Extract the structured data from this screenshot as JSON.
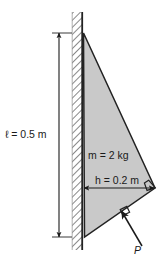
{
  "figure": {
    "background_color": "#ffffff",
    "plate": {
      "name": "triangular-plate",
      "fill_color": "#c9c9c9",
      "stroke_color": "#222222",
      "mass_label": "m = 2 kg",
      "mass_symbol": "m",
      "mass_value": "2",
      "mass_unit": "kg"
    },
    "wall": {
      "name": "vertical-wall",
      "hatch_color": "#555555",
      "line_color": "#222222"
    },
    "dimensions": [
      {
        "name": "length-dimension",
        "label": "ℓ = 0.5 m",
        "symbol": "ℓ",
        "value": "0.5",
        "unit": "m",
        "orientation": "vertical"
      },
      {
        "name": "height-dimension",
        "label": "h = 0.2 m",
        "symbol": "h",
        "value": "0.2",
        "unit": "m",
        "orientation": "horizontal"
      }
    ],
    "force": {
      "name": "applied-force-P",
      "label": "P",
      "arrow_color": "#1a1a1a",
      "perpendicular_marker": true
    },
    "right_angle_marker": {
      "name": "right-angle-marker",
      "present": true
    }
  }
}
